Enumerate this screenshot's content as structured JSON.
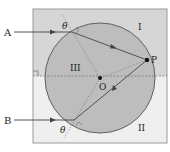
{
  "diagram": {
    "type": "optics-refraction-circle",
    "labels": {
      "ray_a": "A",
      "ray_b": "B",
      "region_1": "I",
      "region_2": "II",
      "region_3": "III",
      "center": "O",
      "point_p": "P",
      "angle_top": "θ",
      "angle_bottom": "θ"
    },
    "colors": {
      "upper_region": "#d6d6d6",
      "lower_region": "#efefef",
      "circle_fill": "#bdbdbd",
      "lines": "#444444",
      "border": "#9a9a9a"
    }
  }
}
